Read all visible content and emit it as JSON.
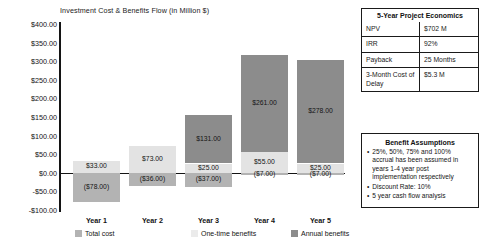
{
  "chart": {
    "title": "Investment Cost & Benefits Flow (in Million $)"
  },
  "chart_data": {
    "type": "bar",
    "stacked": true,
    "title": "Investment Cost & Benefits Flow (in Million $)",
    "xlabel": "",
    "ylabel": "",
    "ylim": [
      -100,
      400
    ],
    "ytick_step": 50,
    "grid": false,
    "legend_position": "bottom",
    "categories": [
      "Year 1",
      "Year 2",
      "Year 3",
      "Year 4",
      "Year 5"
    ],
    "ytick_labels": [
      "$400.00",
      "$350.00",
      "$300.00",
      "$250.00",
      "$200.00",
      "$150.00",
      "$100.00",
      "$50.00",
      "$0.00",
      "-$50.00",
      "-$100.00"
    ],
    "ytick_values": [
      400,
      350,
      300,
      250,
      200,
      150,
      100,
      50,
      0,
      -50,
      -100
    ],
    "series": [
      {
        "name": "Total cost",
        "color": "#b3b3b3",
        "values": [
          -78,
          -36,
          -37,
          -7,
          -7
        ],
        "labels": [
          "($78.00)",
          "($36.00)",
          "($37.00)",
          "($7.00)",
          "($7.00)"
        ]
      },
      {
        "name": "One-time benefits",
        "color": "#e3e3e3",
        "values": [
          33,
          73,
          25,
          55,
          25
        ],
        "labels": [
          "$33.00",
          "$73.00",
          "$25.00",
          "$55.00",
          "$25.00"
        ]
      },
      {
        "name": "Annual benefits",
        "color": "#8c8c8c",
        "values": [
          0,
          0,
          131,
          261,
          278
        ],
        "labels": [
          "",
          "",
          "$131.00",
          "$261.00",
          "$278.00"
        ]
      }
    ]
  },
  "economics": {
    "title": "5-Year Project Economics",
    "rows": [
      {
        "key": "NPV",
        "value": "$702 M"
      },
      {
        "key": "IRR",
        "value": "92%"
      },
      {
        "key": "Payback",
        "value": "25 Months"
      },
      {
        "key": "3-Month Cost of Delay",
        "value": "$5.3 M"
      }
    ]
  },
  "assumptions": {
    "title": "Benefit Assumptions",
    "bullet_glyph": "•",
    "items": [
      "25%, 50%, 75% and 100% accrual has been assumed in years 1-4 year post implementation respectively",
      "Discount Rate: 10%",
      "5 year cash flow analysis"
    ]
  }
}
